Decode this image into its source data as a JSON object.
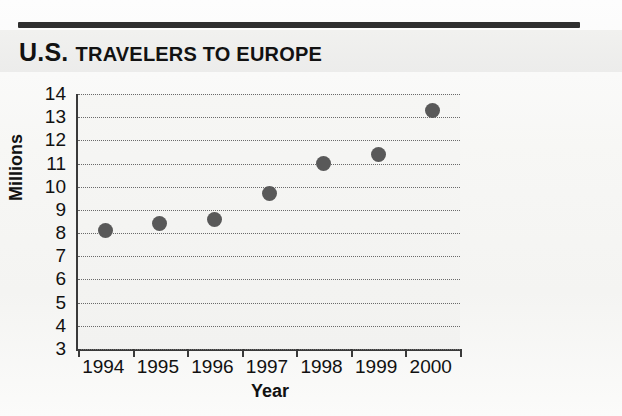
{
  "header": {
    "title_primary": "U.S.",
    "title_rest": "Travelers to Europe",
    "title_full": "U.S. TRAVELERS TO EUROPE"
  },
  "chart_data": {
    "type": "scatter",
    "xlabel": "Year",
    "ylabel": "Millions",
    "categories": [
      "1994",
      "1995",
      "1996",
      "1997",
      "1998",
      "1999",
      "2000"
    ],
    "values": [
      8.1,
      8.4,
      8.6,
      9.7,
      11.0,
      11.4,
      13.3
    ],
    "ylim": [
      3,
      14
    ],
    "yticks": [
      3,
      4,
      5,
      6,
      7,
      8,
      9,
      10,
      11,
      12,
      13,
      14
    ],
    "ytick_labels": [
      "3",
      "4",
      "5",
      "6",
      "7",
      "8",
      "9",
      "10",
      "11",
      "12",
      "13",
      "14"
    ],
    "grid": true,
    "grid_style": "dotted-horizontal",
    "legend": null,
    "marker": "filled-circle",
    "marker_color": "#595959",
    "units": "millions of travelers"
  },
  "colors": {
    "marker": "#595959",
    "axis": "#3a3a3a",
    "grid": "#6a6a6a",
    "rule": "#2f2f2f",
    "text": "#111111",
    "plot_background": "#f4f4f2"
  }
}
